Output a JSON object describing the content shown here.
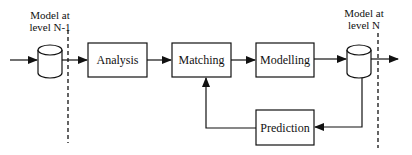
{
  "diagram": {
    "left_model": {
      "line1": "Model at",
      "line2": "level N-1"
    },
    "right_model": {
      "line1": "Model at",
      "line2": "level N"
    },
    "boxes": [
      {
        "id": "analysis",
        "label": "Analysis"
      },
      {
        "id": "matching",
        "label": "Matching"
      },
      {
        "id": "modelling",
        "label": "Modelling"
      },
      {
        "id": "prediction",
        "label": "Prediction"
      }
    ],
    "colors": {
      "stroke": "#111111",
      "background": "#ffffff"
    }
  }
}
